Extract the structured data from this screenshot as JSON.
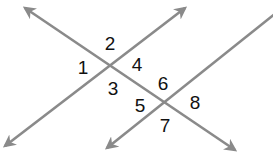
{
  "diagram": {
    "colors": {
      "line": "#8a8a8a",
      "label": "#111111",
      "background": "#ffffff"
    },
    "lines": [
      {
        "id": "transversal",
        "x1": 25,
        "y1": 8,
        "x2": 235,
        "y2": 150,
        "arrow_start": true,
        "arrow_end": true
      },
      {
        "id": "parallel-line-a",
        "x1": 5,
        "y1": 146,
        "x2": 185,
        "y2": 8,
        "arrow_start": true,
        "arrow_end": true
      },
      {
        "id": "parallel-line-b",
        "x1": 107,
        "y1": 148,
        "x2": 276,
        "y2": 13,
        "arrow_start": true,
        "arrow_end": false
      }
    ],
    "intersections": [
      {
        "id": "upper",
        "x": 110,
        "y": 65,
        "angles": [
          "1",
          "2",
          "3",
          "4"
        ]
      },
      {
        "id": "lower",
        "x": 165,
        "y": 103,
        "angles": [
          "5",
          "6",
          "7",
          "8"
        ]
      }
    ],
    "labels": [
      {
        "text": "1",
        "x": 83,
        "y": 67
      },
      {
        "text": "2",
        "x": 110,
        "y": 43
      },
      {
        "text": "3",
        "x": 113,
        "y": 88
      },
      {
        "text": "4",
        "x": 137,
        "y": 64
      },
      {
        "text": "5",
        "x": 140,
        "y": 105
      },
      {
        "text": "6",
        "x": 163,
        "y": 83
      },
      {
        "text": "7",
        "x": 165,
        "y": 125
      },
      {
        "text": "8",
        "x": 195,
        "y": 102
      }
    ]
  }
}
